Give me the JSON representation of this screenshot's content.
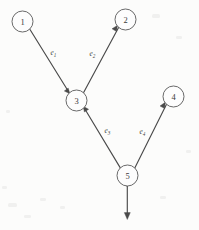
{
  "diagram": {
    "type": "directed-graph",
    "title": "",
    "background_color": "#fdfdfd",
    "stroke_color": "#4a4a4a",
    "node_radius": 10.5,
    "nodes": [
      {
        "id": "1",
        "label": "1",
        "cx": 22.5,
        "cy": 21.5
      },
      {
        "id": "2",
        "label": "2",
        "cx": 125.5,
        "cy": 19.5
      },
      {
        "id": "3",
        "label": "3",
        "cx": 76.5,
        "cy": 100.5
      },
      {
        "id": "4",
        "label": "4",
        "cx": 173.5,
        "cy": 96.5
      },
      {
        "id": "5",
        "label": "5",
        "cx": 127.5,
        "cy": 175.5
      }
    ],
    "edges": [
      {
        "id": "e1",
        "label": "e",
        "subscript": "1",
        "from": "1",
        "to": "3",
        "label_x": 50.5,
        "label_y": 54.5
      },
      {
        "id": "e2",
        "label": "e",
        "subscript": "2",
        "from": "3",
        "to": "2",
        "label_x": 89.5,
        "label_y": 55.5
      },
      {
        "id": "e3",
        "label": "e",
        "subscript": "3",
        "from": "5",
        "to": "3",
        "label_x": 104.5,
        "label_y": 133.0
      },
      {
        "id": "e4",
        "label": "e",
        "subscript": "4",
        "from": "5",
        "to": "4",
        "label_x": 139.5,
        "label_y": 133.5
      },
      {
        "id": "e5",
        "label": "",
        "subscript": "",
        "from": "5",
        "to": "sink",
        "label_x": 0,
        "label_y": 0
      }
    ]
  }
}
